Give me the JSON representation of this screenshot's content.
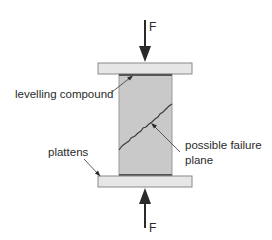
{
  "diagram": {
    "type": "compression-test-setup",
    "forces": {
      "top": {
        "label": "F",
        "direction": "down"
      },
      "bottom": {
        "label": "F",
        "direction": "up"
      }
    },
    "labels": {
      "levelling_compound": "levelling compound",
      "plattens": "plattens",
      "failure_plane_line1": "possible failure",
      "failure_plane_line2": "plane"
    },
    "colors": {
      "platen_fill": "#e6e6e6",
      "platen_stroke": "#8a8a8a",
      "specimen_fill": "#c9c9c9",
      "specimen_stroke": "#9a9a9a",
      "compound": "#555555",
      "arrow": "#2a2a2a",
      "crack": "#3a3a3a",
      "leader": "#4a4a4a",
      "text": "#2a2a2a"
    }
  }
}
